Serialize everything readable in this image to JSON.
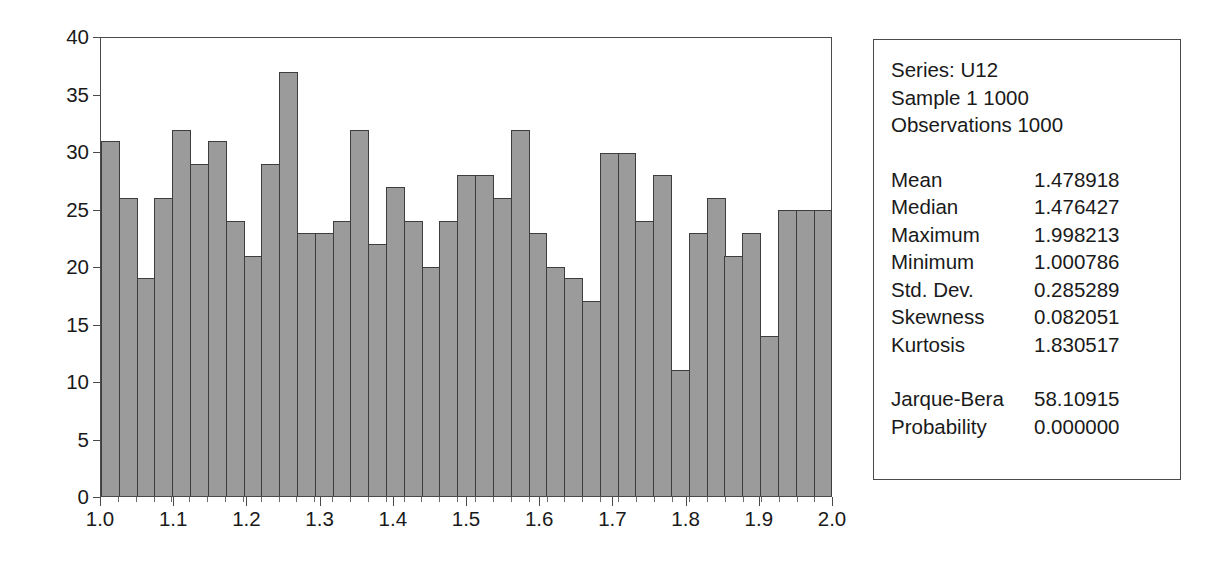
{
  "chart_data": {
    "type": "bar",
    "title": "",
    "xlabel": "",
    "ylabel": "",
    "xlim": [
      1.0,
      2.0
    ],
    "ylim": [
      0,
      40
    ],
    "grid": false,
    "legend": null,
    "y_ticks": [
      40,
      35,
      30,
      25,
      20,
      15,
      10,
      5,
      0
    ],
    "x_ticks": [
      "1.0",
      "1.1",
      "1.2",
      "1.3",
      "1.4",
      "1.5",
      "1.6",
      "1.7",
      "1.8",
      "1.9",
      "2.0"
    ],
    "bin_width": 0.0244,
    "bin_count": 41,
    "categories": [
      "1.000",
      "1.024",
      "1.049",
      "1.073",
      "1.098",
      "1.122",
      "1.146",
      "1.171",
      "1.195",
      "1.220",
      "1.244",
      "1.268",
      "1.293",
      "1.317",
      "1.341",
      "1.366",
      "1.390",
      "1.415",
      "1.439",
      "1.463",
      "1.488",
      "1.512",
      "1.537",
      "1.561",
      "1.585",
      "1.610",
      "1.634",
      "1.659",
      "1.683",
      "1.707",
      "1.732",
      "1.756",
      "1.780",
      "1.805",
      "1.829",
      "1.854",
      "1.878",
      "1.902",
      "1.927",
      "1.951",
      "1.976"
    ],
    "values": [
      31,
      26,
      19,
      26,
      32,
      29,
      31,
      24,
      21,
      29,
      37,
      23,
      23,
      24,
      32,
      22,
      27,
      24,
      20,
      24,
      28,
      28,
      26,
      32,
      23,
      20,
      19,
      17,
      30,
      30,
      24,
      28,
      11,
      23,
      26,
      21,
      23,
      14,
      25,
      25,
      25
    ],
    "bar_color": "#9b9b9b",
    "bar_edge_color": "#3d3d3d",
    "axis_color": "#4a4a4a"
  },
  "stats_panel": {
    "series_line": "Series: U12",
    "sample_line": "Sample 1 1000",
    "observations_line": "Observations 1000",
    "rows": [
      {
        "label": "Mean",
        "value": "1.478918"
      },
      {
        "label": "Median",
        "value": "1.476427"
      },
      {
        "label": "Maximum",
        "value": "1.998213"
      },
      {
        "label": "Minimum",
        "value": "1.000786"
      },
      {
        "label": "Std. Dev.",
        "value": "0.285289"
      },
      {
        "label": "Skewness",
        "value": "0.082051"
      },
      {
        "label": "Kurtosis",
        "value": "1.830517"
      }
    ],
    "test_rows": [
      {
        "label": "Jarque-Bera",
        "value": "58.10915"
      },
      {
        "label": "Probability",
        "value": "0.000000"
      }
    ]
  }
}
